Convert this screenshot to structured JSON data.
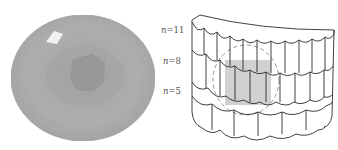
{
  "figure": {
    "left": {
      "description": "grey circular specimen photo",
      "colors": {
        "outer": "#a9a9a9",
        "inner_ring": "#9a9a9a",
        "core": "#8e8e8e",
        "highlight": "#f4f4f4"
      }
    },
    "right": {
      "description": "curved multi-layer scalloped sheet schematic",
      "labels": [
        {
          "var": "n",
          "value": "11",
          "text": "n=11"
        },
        {
          "var": "n",
          "value": "8",
          "text": "n=8"
        },
        {
          "var": "n",
          "value": "5",
          "text": "n=5"
        }
      ],
      "colors": {
        "stroke": "#2b2b2b",
        "shaded": "#c8c8c8",
        "dashed_circle": "#888888"
      }
    }
  }
}
